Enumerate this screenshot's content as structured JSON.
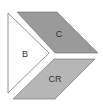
{
  "diagram": {
    "shapes": [
      {
        "id": "B",
        "label": "B",
        "kind": "triangle",
        "fill": "#ffffff",
        "stroke": "#777777"
      },
      {
        "id": "C",
        "label": "C",
        "kind": "parallelogram",
        "fill": "#9a9a9a",
        "stroke": "#6a6a6a"
      },
      {
        "id": "CR",
        "label": "CR",
        "kind": "parallelogram",
        "fill": "#b6b6b6",
        "stroke": "#6a6a6a"
      }
    ]
  }
}
